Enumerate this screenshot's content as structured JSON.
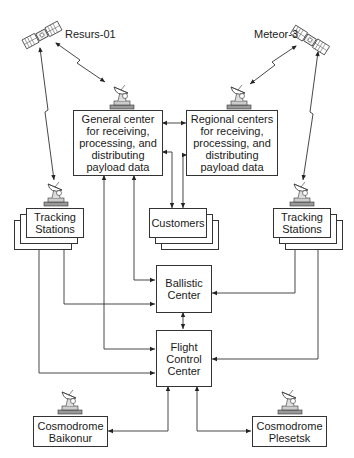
{
  "diagram": {
    "satellites": [
      {
        "id": "resurs",
        "label": "Resurs-01"
      },
      {
        "id": "meteor",
        "label": "Meteor-3"
      }
    ],
    "nodes": {
      "general_center": "General center\nfor receiving,\nprocessing, and\ndistributing\npayload data",
      "regional_centers": "Regional centers\nfor receiving,\nprocessing, and\ndistributing\npayload data",
      "tracking_left": "Tracking\nStations",
      "customers": "Customers",
      "tracking_right": "Tracking\nStations",
      "ballistic_center": "Ballistic\nCenter",
      "flight_control_center": "Flight\nControl\nCenter",
      "cosmodrome_baikonur": "Cosmodrome\nBaikonur",
      "cosmodrome_plesetsk": "Cosmodrome\nPlesetsk"
    },
    "icons": {
      "satellite": "satellite-icon",
      "antenna": "dish-antenna-icon"
    },
    "colors": {
      "line": "#333333",
      "background": "#ffffff"
    }
  }
}
